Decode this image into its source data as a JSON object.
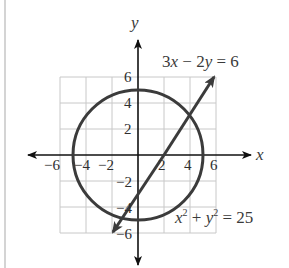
{
  "figure": {
    "axes": {
      "x_label": "x",
      "y_label": "y",
      "x_ticks": [
        "−6",
        "−4",
        "−2",
        "2",
        "4",
        "6"
      ],
      "y_ticks": [
        "6",
        "4",
        "2",
        "−2",
        "−4",
        "−6"
      ],
      "grid_range": {
        "x": [
          -6,
          6
        ],
        "y": [
          -6,
          6
        ],
        "step": 2
      }
    },
    "curves": [
      {
        "name": "circle",
        "equation_lhs_a": "x",
        "equation_exp_a": "2",
        "equation_plus": " + ",
        "equation_lhs_b": "y",
        "equation_exp_b": "2",
        "equation_rhs": " = 25",
        "center": [
          0,
          0
        ],
        "radius": 5
      },
      {
        "name": "line",
        "eq_a": "3",
        "eq_x": "x",
        "eq_minus": " − 2",
        "eq_y": "y",
        "eq_rhs": " = 6",
        "through": [
          [
            -2,
            -6
          ],
          [
            6,
            6
          ]
        ]
      }
    ],
    "colors": {
      "curve": "#3b3b3b",
      "grid": "#c8c8c8",
      "axis": "#111111",
      "text": "#3a3a3a"
    }
  }
}
